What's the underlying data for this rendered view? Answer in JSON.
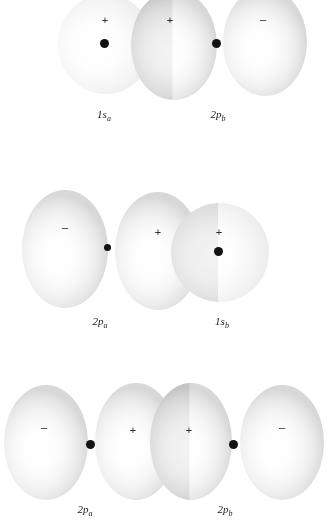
{
  "figure": {
    "background_color": "#ffffff",
    "lobe_fill_color": "#f2f2f2",
    "lobe_edge_color": "#d8d8d8",
    "nucleus_color": "#121212",
    "sign_color": "#2b2b2b",
    "label_color": "#1a1a1a",
    "width": 328,
    "height": 530
  },
  "rows": [
    {
      "id": "row-1",
      "description": "1s orbital overlapping the positive lobe of a 2p orbital",
      "labels": [
        {
          "id": "label-1s-a",
          "text": "1s",
          "sub": "a",
          "x": 104,
          "y": 115
        },
        {
          "id": "label-2p-b",
          "text": "2p",
          "sub": "b",
          "x": 218,
          "y": 115
        }
      ],
      "signs": [
        {
          "id": "sign-r1-1",
          "text": "+",
          "x": 105,
          "y": 20
        },
        {
          "id": "sign-r1-2",
          "text": "+",
          "x": 170,
          "y": 20
        },
        {
          "id": "sign-r1-3",
          "text": "−",
          "x": 263,
          "y": 20
        }
      ],
      "nuclei": [
        {
          "id": "nucleus-1s-a",
          "x": 105,
          "y": 44
        },
        {
          "id": "nucleus-2p-b",
          "x": 217,
          "y": 44
        }
      ]
    },
    {
      "id": "row-2",
      "description": "Positive lobe of a 2p orbital overlapping a 1s orbital",
      "labels": [
        {
          "id": "label-2p-a",
          "text": "2p",
          "sub": "a",
          "x": 100,
          "y": 322
        },
        {
          "id": "label-1s-b",
          "text": "1s",
          "sub": "b",
          "x": 222,
          "y": 322
        }
      ],
      "signs": [
        {
          "id": "sign-r2-1",
          "text": "−",
          "x": 65,
          "y": 228
        },
        {
          "id": "sign-r2-2",
          "text": "+",
          "x": 158,
          "y": 232
        },
        {
          "id": "sign-r2-3",
          "text": "+",
          "x": 219,
          "y": 232
        }
      ],
      "nuclei": [
        {
          "id": "nucleus-2p-a",
          "x": 108,
          "y": 248
        },
        {
          "id": "nucleus-1s-b",
          "x": 219,
          "y": 252
        }
      ]
    },
    {
      "id": "row-3",
      "description": "Two 2p orbitals overlapping end-on with positive lobes facing",
      "labels": [
        {
          "id": "label-2p-a-3",
          "text": "2p",
          "sub": "a",
          "x": 85,
          "y": 510
        },
        {
          "id": "label-2p-b-3",
          "text": "2p",
          "sub": "b",
          "x": 225,
          "y": 510
        }
      ],
      "signs": [
        {
          "id": "sign-r3-1",
          "text": "−",
          "x": 44,
          "y": 428
        },
        {
          "id": "sign-r3-2",
          "text": "+",
          "x": 133,
          "y": 430
        },
        {
          "id": "sign-r3-3",
          "text": "+",
          "x": 189,
          "y": 430
        },
        {
          "id": "sign-r3-4",
          "text": "−",
          "x": 282,
          "y": 428
        }
      ],
      "nuclei": [
        {
          "id": "nucleus-2p-a-3",
          "x": 91,
          "y": 445
        },
        {
          "id": "nucleus-2p-b-3",
          "x": 234,
          "y": 445
        }
      ]
    }
  ]
}
